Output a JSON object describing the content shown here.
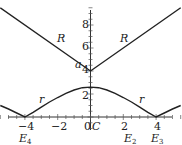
{
  "chart_data": {
    "type": "line",
    "title": "",
    "xlabel": "",
    "ylabel": "",
    "xlim": [
      -5.5,
      5.5
    ],
    "ylim": [
      0,
      9.5
    ],
    "grid": false,
    "x_ticks": [
      -4,
      -2,
      0,
      2,
      4
    ],
    "y_ticks": [
      2,
      4,
      6,
      8
    ],
    "series": [
      {
        "name": "R",
        "x": [
          -5.5,
          0,
          5.5
        ],
        "y": [
          9.5,
          4,
          9.5
        ]
      },
      {
        "name": "r",
        "x": [
          -5.5,
          -5,
          -4.5,
          -4,
          -3.5,
          -3,
          -2.5,
          -2,
          -1.5,
          -1,
          -0.5,
          0,
          0.5,
          1,
          1.5,
          2,
          2.5,
          3,
          3.5,
          4,
          4.5,
          5,
          5.5
        ],
        "y": [
          1.0,
          0.7,
          0.35,
          0,
          0.4,
          0.85,
          1.3,
          1.7,
          2.05,
          2.35,
          2.55,
          2.6,
          2.55,
          2.35,
          2.05,
          1.7,
          1.3,
          0.85,
          0.4,
          0,
          0.35,
          0.7,
          1.0
        ]
      }
    ],
    "annotations": [
      {
        "text": "R",
        "x": -2.6,
        "y": 7.0,
        "italic": true
      },
      {
        "text": "R",
        "x": 3.0,
        "y": 7.0,
        "italic": true
      },
      {
        "text": "a",
        "x": -0.55,
        "y": 4.4,
        "italic": true
      },
      {
        "text": "r",
        "x": -3.0,
        "y": 1.35,
        "italic": true
      },
      {
        "text": "r",
        "x": 3.0,
        "y": 1.35,
        "italic": true
      },
      {
        "text": "C",
        "x": 0.35,
        "y": -0.9,
        "italic": true
      },
      {
        "text": "E4",
        "x": -4.2,
        "y": -2.0,
        "italic": true
      },
      {
        "text": "E2",
        "x": 2.1,
        "y": -2.0,
        "italic": true
      },
      {
        "text": "E3",
        "x": 3.8,
        "y": -2.0,
        "italic": true
      }
    ]
  },
  "labels": {
    "R_left": "R",
    "R_right": "R",
    "a": "a",
    "r_left": "r",
    "r_right": "r",
    "C": "C",
    "E4": "E",
    "E4_sub": "4",
    "E2": "E",
    "E2_sub": "2",
    "E3": "E",
    "E3_sub": "3",
    "xt_m4": "−4",
    "xt_m2": "−2",
    "xt_0": "0",
    "xt_2": "2",
    "xt_4": "4",
    "yt_2": "2",
    "yt_4": "4",
    "yt_6": "6",
    "yt_8": "8"
  }
}
